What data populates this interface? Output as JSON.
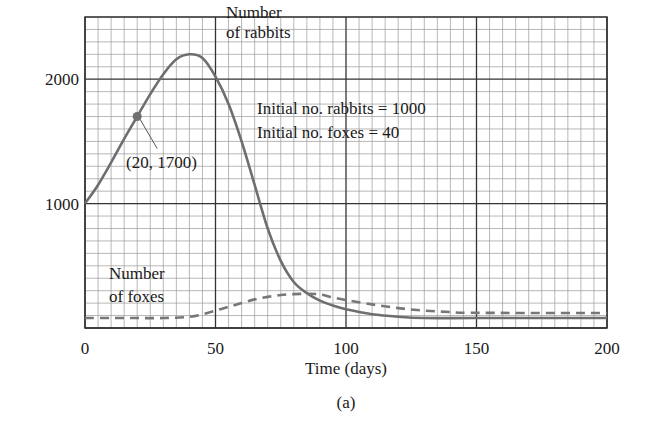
{
  "chart_data": {
    "type": "line",
    "title": "",
    "caption": "(a)",
    "xlabel": "Time (days)",
    "ylabel": "",
    "xlim": [
      0,
      200
    ],
    "ylim": [
      0,
      2500
    ],
    "x_ticks": [
      0,
      50,
      100,
      150,
      200
    ],
    "y_ticks": [
      1000,
      2000
    ],
    "grid": {
      "on": true,
      "major_x": 50,
      "minor_x": 5,
      "major_y": 1000,
      "minor_y": 100
    },
    "legend": "none (inline annotations)",
    "series": [
      {
        "name": "Number of rabbits",
        "style": "solid",
        "color": "#6e6e6e",
        "x": [
          0,
          5,
          10,
          15,
          20,
          25,
          30,
          35,
          40,
          45,
          50,
          55,
          60,
          65,
          70,
          75,
          80,
          85,
          90,
          95,
          100,
          110,
          120,
          130,
          150,
          200
        ],
        "values": [
          1000,
          1150,
          1330,
          1520,
          1700,
          1880,
          2040,
          2160,
          2200,
          2170,
          2020,
          1800,
          1500,
          1150,
          800,
          540,
          370,
          280,
          220,
          180,
          150,
          110,
          90,
          80,
          80,
          80
        ]
      },
      {
        "name": "Number of foxes",
        "style": "dashed",
        "color": "#777777",
        "x": [
          0,
          10,
          20,
          30,
          40,
          45,
          50,
          55,
          60,
          65,
          70,
          75,
          80,
          85,
          90,
          95,
          100,
          110,
          120,
          130,
          140,
          150,
          200
        ],
        "values": [
          80,
          80,
          80,
          80,
          90,
          110,
          140,
          170,
          200,
          230,
          250,
          265,
          272,
          275,
          270,
          245,
          225,
          190,
          160,
          140,
          128,
          122,
          120
        ]
      }
    ],
    "annotations": [
      {
        "text_lines": [
          "Number",
          "of rabbits"
        ],
        "x": 53,
        "y": 2400
      },
      {
        "text_lines": [
          "Initial no. rabbits = 1000",
          "Initial no. foxes = 40"
        ],
        "x": 66,
        "y": 1750
      },
      {
        "text": "(20, 1700)",
        "point": [
          20,
          1700
        ],
        "marker": "dot"
      },
      {
        "text_lines": [
          "Number",
          "of foxes"
        ],
        "x": 8,
        "y": 400
      }
    ]
  },
  "labels": {
    "xaxis_title": "Time (days)",
    "caption": "(a)",
    "rabbits_label_1": "Number",
    "rabbits_label_2": "of rabbits",
    "foxes_label_1": "Number",
    "foxes_label_2": "of foxes",
    "initial_rabbits": "Initial no. rabbits = 1000",
    "initial_foxes": "Initial no. foxes = 40",
    "point_label": "(20, 1700)"
  }
}
